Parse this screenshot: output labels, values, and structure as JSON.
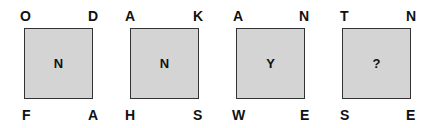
{
  "puzzle": {
    "colors": {
      "box_fill": "#d4d4d4",
      "box_border": "#333333",
      "text": "#111111"
    },
    "squares": [
      {
        "top_left": "O",
        "top_right": "D",
        "bottom_left": "F",
        "bottom_right": "A",
        "center": "N"
      },
      {
        "top_left": "A",
        "top_right": "K",
        "bottom_left": "H",
        "bottom_right": "S",
        "center": "N"
      },
      {
        "top_left": "A",
        "top_right": "N",
        "bottom_left": "W",
        "bottom_right": "E",
        "center": "Y"
      },
      {
        "top_left": "T",
        "top_right": "N",
        "bottom_left": "S",
        "bottom_right": "E",
        "center": "?"
      }
    ]
  }
}
